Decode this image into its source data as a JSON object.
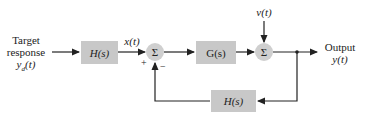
{
  "diagram": {
    "type": "feedback control block diagram",
    "input": {
      "line1": "Target",
      "line2": "response",
      "line3": "y_d(t)",
      "line3_display": "yd(t)"
    },
    "blocks": [
      {
        "id": "prefilter",
        "label": "H(s)"
      },
      {
        "id": "plant",
        "label": "G(s)"
      },
      {
        "id": "feedback",
        "label": "H(s)"
      }
    ],
    "signals": {
      "x": "x(t)",
      "disturbance": "v(t)"
    },
    "summing_junctions": [
      {
        "id": "sum1",
        "symbol": "Σ",
        "signs": [
          "+",
          "−"
        ]
      },
      {
        "id": "sum2",
        "symbol": "Σ"
      }
    ],
    "output": {
      "line1": "Output",
      "line2": "y(t)"
    },
    "colors": {
      "block_fill": "#c8c8c8",
      "line": "#222222"
    }
  }
}
